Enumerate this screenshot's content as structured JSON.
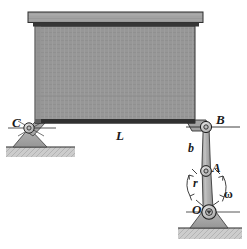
{
  "figure": {
    "type": "engineering-mechanics-diagram",
    "background": "#ffffff"
  },
  "labels": {
    "C": "C",
    "L": "L",
    "B": "B",
    "b": "b",
    "A": "A",
    "r": "r",
    "omega": "ω",
    "O": "O"
  },
  "colors": {
    "body_fill": "#979797",
    "body_edge": "#2b2b2b",
    "plate_fill": "#9d9d9d",
    "plate_shadow": "#3a3a3a",
    "link_fill": "#b0b0b0",
    "support_fill": "#a8a8a8",
    "ground_fill": "#c9c9c9",
    "line": "#1f1f1f",
    "label": "#1a1a1a"
  },
  "geometry": {
    "body": {
      "x": 35,
      "y": 26,
      "width": 160,
      "height": 97,
      "note": "large rectangular block, bottom edge dark"
    },
    "top_plate": {
      "x": 28,
      "y": 12,
      "width": 175,
      "height": 11
    },
    "support_C": {
      "pin_cx": 29,
      "pin_cy": 128,
      "pin_r": 5,
      "ground_y": 147
    },
    "joint_B": {
      "cx": 208,
      "cy": 127,
      "r": 5.5
    },
    "joint_A": {
      "cx": 206,
      "cy": 171,
      "r": 5.5
    },
    "joint_O": {
      "cx": 208,
      "cy": 212,
      "r": 7,
      "ground_y": 228
    },
    "link_b": {
      "from": "B",
      "to": "A"
    },
    "link_r": {
      "from": "A",
      "to": "O"
    }
  },
  "annotations": {
    "omega_direction": "counterclockwise arc arrow at crank O-A",
    "r_arc": "arc annotation left of crank denoting radius r",
    "L_dimension": "horizontal span between supports C and B",
    "b_dimension": "length of connecting rod from B to A"
  }
}
